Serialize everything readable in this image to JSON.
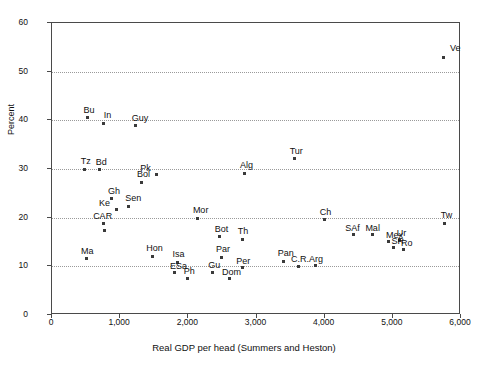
{
  "chart_data": {
    "type": "scatter",
    "title": "",
    "xlabel": "Real GDP per head (Summers and Heston)",
    "ylabel": "Percent",
    "xlim": [
      0,
      6000
    ],
    "ylim": [
      0,
      60
    ],
    "xticks": [
      "0",
      "1,000",
      "2,000",
      "3,000",
      "4,000",
      "5,000",
      "6,000"
    ],
    "xtick_values": [
      0,
      1000,
      2000,
      3000,
      4000,
      5000,
      6000
    ],
    "yticks": [
      "0",
      "10",
      "20",
      "30",
      "40",
      "50",
      "60"
    ],
    "ytick_values": [
      0,
      10,
      20,
      30,
      40,
      50,
      60
    ],
    "grid": "horizontal-dotted",
    "legend": "none",
    "marker": "small-filled-square",
    "points": [
      {
        "label": "Ve",
        "x": 5750,
        "y": 53.0,
        "lx": 6,
        "ly": -13
      },
      {
        "label": "Bu",
        "x": 520,
        "y": 40.5,
        "lx": -4,
        "ly": -12
      },
      {
        "label": "In",
        "x": 760,
        "y": 39.4,
        "lx": 0,
        "ly": -12
      },
      {
        "label": "Guy",
        "x": 1230,
        "y": 38.9,
        "lx": -4,
        "ly": -12
      },
      {
        "label": "Tur",
        "x": 3560,
        "y": 32.1,
        "lx": -5,
        "ly": -12
      },
      {
        "label": "Tz",
        "x": 480,
        "y": 29.9,
        "lx": -4,
        "ly": -12
      },
      {
        "label": "Bd",
        "x": 700,
        "y": 29.8,
        "lx": -4,
        "ly": -12
      },
      {
        "label": "Pk",
        "x": 1530,
        "y": 28.8,
        "lx": -16,
        "ly": -11
      },
      {
        "label": "Alg",
        "x": 2830,
        "y": 29.1,
        "lx": -5,
        "ly": -12
      },
      {
        "label": "Bol",
        "x": 1320,
        "y": 27.3,
        "lx": -5,
        "ly": -12
      },
      {
        "label": "Gh",
        "x": 880,
        "y": 23.9,
        "lx": -4,
        "ly": -12
      },
      {
        "label": "Sen",
        "x": 1120,
        "y": 22.3,
        "lx": -3,
        "ly": -12
      },
      {
        "label": "Ke",
        "x": 940,
        "y": 21.6,
        "lx": -17,
        "ly": -11
      },
      {
        "label": "Mor",
        "x": 2140,
        "y": 19.9,
        "lx": -5,
        "ly": -12
      },
      {
        "label": "Ch",
        "x": 4000,
        "y": 19.6,
        "lx": -5,
        "ly": -12
      },
      {
        "label": "Tw",
        "x": 5760,
        "y": 18.9,
        "lx": -4,
        "ly": -12
      },
      {
        "label": "CAR",
        "x": 750,
        "y": 18.8,
        "lx": -10,
        "ly": -12
      },
      {
        "label": "SAf",
        "x": 4420,
        "y": 16.5,
        "lx": -8,
        "ly": -11
      },
      {
        "label": "Mal",
        "x": 4700,
        "y": 16.5,
        "lx": -7,
        "ly": -11
      },
      {
        "label": "Bot",
        "x": 2460,
        "y": 16.1,
        "lx": -5,
        "ly": -12
      },
      {
        "label": "Th",
        "x": 2800,
        "y": 15.6,
        "lx": -5,
        "ly": -12
      },
      {
        "label": "Mex",
        "x": 4930,
        "y": 15.1,
        "lx": -2,
        "ly": -11
      },
      {
        "label": "Ur",
        "x": 5100,
        "y": 15.3,
        "lx": -3,
        "ly": -12
      },
      {
        "label": "SR",
        "x": 5010,
        "y": 13.8,
        "lx": -2,
        "ly": -11
      },
      {
        "label": "Ro",
        "x": 5150,
        "y": 13.4,
        "lx": -2,
        "ly": -11
      },
      {
        "label": "Ma",
        "x": 500,
        "y": 11.6,
        "lx": -5,
        "ly": -12
      },
      {
        "label": "Hon",
        "x": 1470,
        "y": 12.1,
        "lx": -6,
        "ly": -12
      },
      {
        "label": "Par",
        "x": 2480,
        "y": 11.9,
        "lx": -5,
        "ly": -12
      },
      {
        "label": "Isa",
        "x": 1840,
        "y": 10.8,
        "lx": -5,
        "ly": -12
      },
      {
        "label": "Pan",
        "x": 3400,
        "y": 11.0,
        "lx": -6,
        "ly": -12
      },
      {
        "label": "C.R.",
        "x": 3610,
        "y": 10.0,
        "lx": -7,
        "ly": -11
      },
      {
        "label": "Arg",
        "x": 3860,
        "y": 10.1,
        "lx": -6,
        "ly": -11
      },
      {
        "label": "Per",
        "x": 2790,
        "y": 9.7,
        "lx": -6,
        "ly": -11
      },
      {
        "label": "ESa",
        "x": 1790,
        "y": 8.7,
        "lx": -4,
        "ly": -11
      },
      {
        "label": "Gu",
        "x": 2350,
        "y": 8.8,
        "lx": -4,
        "ly": -11
      },
      {
        "label": "Ph",
        "x": 1990,
        "y": 7.6,
        "lx": -4,
        "ly": -11
      },
      {
        "label": "Dom",
        "x": 2610,
        "y": 7.4,
        "lx": -8,
        "ly": -11
      }
    ]
  },
  "extra_points": [
    {
      "x": 770,
      "y": 17.4
    }
  ]
}
